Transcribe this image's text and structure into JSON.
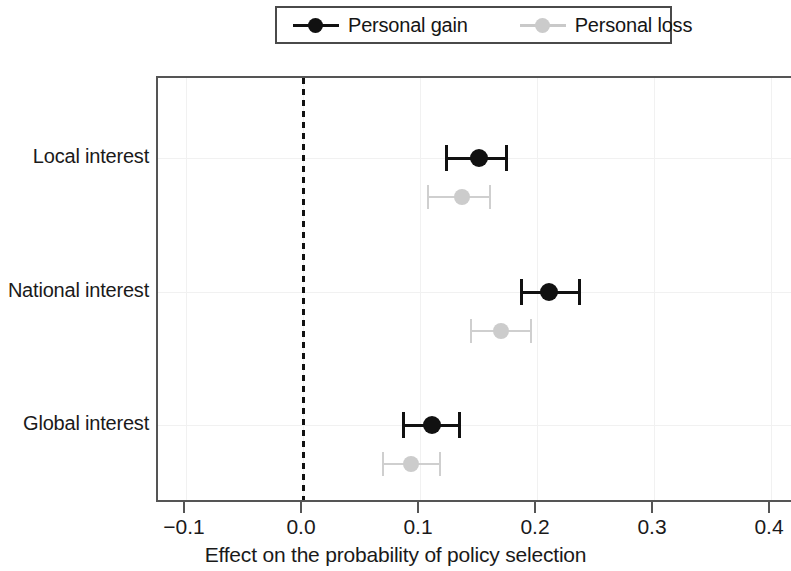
{
  "legend": {
    "entries": [
      {
        "label": "Personal gain",
        "color": "#111111",
        "key": "gain"
      },
      {
        "label": "Personal loss",
        "color": "#cccccc",
        "key": "loss"
      }
    ]
  },
  "axis": {
    "x_title": "Effect on the probability of policy selection",
    "x_ticklabels": [
      "−0.1",
      "0.0",
      "0.1",
      "0.2",
      "0.3",
      "0.4"
    ],
    "x_tickvalues": [
      -0.1,
      0.0,
      0.1,
      0.2,
      0.3,
      0.4
    ],
    "y_categories": [
      "Local interest",
      "National interest",
      "Global interest"
    ]
  },
  "chart_data": {
    "type": "scatter",
    "title": "",
    "subtitle": "",
    "xlabel": "Effect on the probability of policy selection",
    "ylabel": "",
    "xlim": [
      -0.14,
      0.43
    ],
    "xticks": [
      -0.1,
      0.0,
      0.1,
      0.2,
      0.3,
      0.4
    ],
    "categories": [
      "Local interest",
      "National interest",
      "Global interest"
    ],
    "grid": true,
    "legend_position": "top-center",
    "reference_line": {
      "x": 0.0,
      "style": "dotted",
      "color": "#111111"
    },
    "orientation": "horizontal",
    "error_bars": "95% confidence interval",
    "series": [
      {
        "name": "Personal gain",
        "color": "#111111",
        "values": [
          0.15,
          0.21,
          0.11
        ],
        "ci_low": [
          0.123,
          0.187,
          0.086
        ],
        "ci_high": [
          0.174,
          0.236,
          0.134
        ]
      },
      {
        "name": "Personal loss",
        "color": "#cccccc",
        "values": [
          0.136,
          0.169,
          0.092
        ],
        "ci_low": [
          0.107,
          0.144,
          0.068
        ],
        "ci_high": [
          0.16,
          0.195,
          0.117
        ]
      }
    ]
  }
}
